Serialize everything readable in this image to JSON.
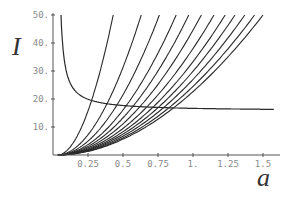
{
  "chart_data": {
    "type": "line",
    "title": "",
    "xlabel": "a",
    "ylabel": "I",
    "xlim": [
      0,
      1.6
    ],
    "ylim": [
      0,
      50
    ],
    "grid": false,
    "legend": null,
    "x_ticks": [
      0.25,
      0.5,
      0.75,
      1.0,
      1.25,
      1.5
    ],
    "x_tick_labels": [
      "0.25",
      "0.5",
      "0.75",
      "1.",
      "1.25",
      "1.5"
    ],
    "y_ticks": [
      10,
      20,
      30,
      40,
      50
    ],
    "y_tick_labels": [
      "10.",
      "20.",
      "30.",
      "40.",
      "50."
    ],
    "series": [
      {
        "name": "decreasing",
        "description": "decreasing curve from I=50 at a≈0.057 flattening toward I≈15.7",
        "x": [
          0.057,
          0.08,
          0.12,
          0.18,
          0.25,
          0.35,
          0.5,
          0.75,
          1.0,
          1.25,
          1.58
        ],
        "values": [
          50,
          32,
          23,
          19.3,
          17.6,
          16.6,
          16.1,
          15.8,
          15.7,
          15.7,
          15.7
        ]
      },
      {
        "name": "increasing family",
        "description": "12 increasing curves starting near a≈0.035, I=0, each reaching I=50 at the listed a",
        "a_at_I50": [
          0.43,
          0.63,
          0.76,
          0.88,
          0.97,
          1.06,
          1.15,
          1.23,
          1.3,
          1.37,
          1.44,
          1.5
        ],
        "a0": 0.035,
        "exponent": 1.9
      }
    ]
  },
  "labels": {
    "x_axis": "a",
    "y_axis": "I"
  }
}
